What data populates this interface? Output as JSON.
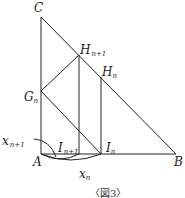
{
  "figure": {
    "caption": "〈図3〉",
    "labels": {
      "C": "C",
      "A": "A",
      "B": "B",
      "H_n1": "H",
      "H_n1_sub": "n+1",
      "H_n": "H",
      "H_n_sub": "n",
      "G_n": "G",
      "G_n_sub": "n",
      "I_n1": "I",
      "I_n1_sub": "n+1",
      "I_n": "I",
      "I_n_sub": "n",
      "x_n1": "x",
      "x_n1_sub": "n+1",
      "x_n": "x",
      "x_n_sub": "n"
    },
    "line_color": "#222222"
  }
}
